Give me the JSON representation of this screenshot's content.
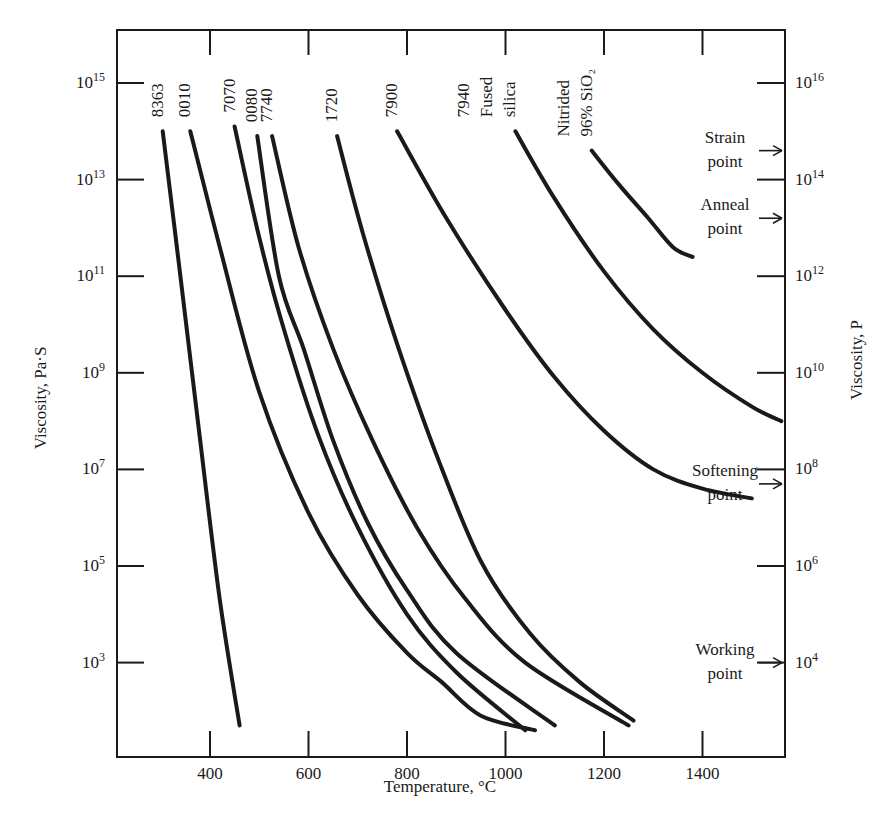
{
  "chart_data": {
    "type": "line",
    "title": "",
    "xlabel": "Temperature, °C",
    "ylabel": "Viscosity, Pa·S",
    "ylabel_right": "Viscosity, P",
    "x_scale": "linear",
    "y_scale": "log",
    "xlim": [
      215,
      1550
    ],
    "ylim_log10_pa_s": [
      0.8,
      16.1
    ],
    "grid": false,
    "x_ticks": [
      {
        "value": 400,
        "label": "400"
      },
      {
        "value": 600,
        "label": "600"
      },
      {
        "value": 800,
        "label": "800"
      },
      {
        "value": 1000,
        "label": "1000"
      },
      {
        "value": 1200,
        "label": "1200"
      },
      {
        "value": 1400,
        "label": "1400"
      }
    ],
    "y_ticks_left": [
      {
        "exp": 15,
        "base": "10",
        "sup": "15"
      },
      {
        "exp": 13,
        "base": "10",
        "sup": "13"
      },
      {
        "exp": 11,
        "base": "10",
        "sup": "11"
      },
      {
        "exp": 9,
        "base": "10",
        "sup": "9"
      },
      {
        "exp": 7,
        "base": "10",
        "sup": "7"
      },
      {
        "exp": 5,
        "base": "10",
        "sup": "5"
      },
      {
        "exp": 3,
        "base": "10",
        "sup": "3"
      }
    ],
    "y_ticks_right": [
      {
        "exp_pa_s": 15,
        "base": "10",
        "sup": "16"
      },
      {
        "exp_pa_s": 13,
        "base": "10",
        "sup": "14"
      },
      {
        "exp_pa_s": 11,
        "base": "10",
        "sup": "12"
      },
      {
        "exp_pa_s": 9,
        "base": "10",
        "sup": "10"
      },
      {
        "exp_pa_s": 7,
        "base": "10",
        "sup": "8"
      },
      {
        "exp_pa_s": 5,
        "base": "10",
        "sup": "6"
      },
      {
        "exp_pa_s": 3,
        "base": "10",
        "sup": "4"
      }
    ],
    "reference_points": [
      {
        "name": "Strain point",
        "lines": [
          "Strain",
          "point"
        ],
        "log10_pa_s": 13.6
      },
      {
        "name": "Anneal point",
        "lines": [
          "Anneal",
          "point"
        ],
        "log10_pa_s": 12.2
      },
      {
        "name": "Softening point",
        "lines": [
          "Softening",
          "point"
        ],
        "log10_pa_s": 6.7
      },
      {
        "name": "Working point",
        "lines": [
          "Working",
          "point"
        ],
        "log10_pa_s": 3.0
      }
    ],
    "series": [
      {
        "name": "8363",
        "label_lines": [
          "8363"
        ],
        "points": [
          [
            304,
            14.0
          ],
          [
            340,
            11.0
          ],
          [
            380,
            7.6
          ],
          [
            420,
            4.3
          ],
          [
            460,
            1.7
          ]
        ]
      },
      {
        "name": "0010",
        "label_lines": [
          "0010"
        ],
        "points": [
          [
            360,
            14.0
          ],
          [
            420,
            11.6
          ],
          [
            500,
            8.6
          ],
          [
            600,
            6.1
          ],
          [
            700,
            4.4
          ],
          [
            800,
            3.2
          ],
          [
            870,
            2.6
          ],
          [
            950,
            1.9
          ],
          [
            1060,
            1.6
          ]
        ]
      },
      {
        "name": "7070",
        "label_lines": [
          "7070"
        ],
        "points": [
          [
            450,
            14.1
          ],
          [
            500,
            11.8
          ],
          [
            550,
            9.9
          ],
          [
            620,
            7.7
          ],
          [
            700,
            5.8
          ],
          [
            800,
            4.0
          ],
          [
            900,
            2.8
          ],
          [
            1040,
            1.6
          ]
        ]
      },
      {
        "name": "0080",
        "label_lines": [
          "0080"
        ],
        "points": [
          [
            496,
            13.9
          ],
          [
            540,
            11.0
          ],
          [
            590,
            9.5
          ],
          [
            650,
            7.6
          ],
          [
            720,
            5.9
          ],
          [
            800,
            4.5
          ],
          [
            900,
            3.2
          ],
          [
            1100,
            1.7
          ]
        ]
      },
      {
        "name": "7740",
        "label_lines": [
          "7740"
        ],
        "points": [
          [
            526,
            13.9
          ],
          [
            580,
            11.6
          ],
          [
            650,
            9.5
          ],
          [
            730,
            7.6
          ],
          [
            820,
            5.8
          ],
          [
            920,
            4.3
          ],
          [
            1040,
            3.0
          ],
          [
            1250,
            1.7
          ]
        ]
      },
      {
        "name": "1720",
        "label_lines": [
          "1720"
        ],
        "points": [
          [
            658,
            13.9
          ],
          [
            710,
            11.9
          ],
          [
            780,
            9.6
          ],
          [
            860,
            7.3
          ],
          [
            950,
            5.1
          ],
          [
            1050,
            3.6
          ],
          [
            1150,
            2.6
          ],
          [
            1260,
            1.8
          ]
        ]
      },
      {
        "name": "7900",
        "label_lines": [
          "7900"
        ],
        "points": [
          [
            780,
            14.0
          ],
          [
            880,
            12.2
          ],
          [
            1000,
            10.3
          ],
          [
            1100,
            8.9
          ],
          [
            1200,
            7.8
          ],
          [
            1300,
            7.0
          ],
          [
            1400,
            6.6
          ],
          [
            1500,
            6.4
          ]
        ]
      },
      {
        "name": "7940 Fused silica",
        "label_lines": [
          "7940",
          "Fused",
          "silica"
        ],
        "points": [
          [
            1020,
            14.0
          ],
          [
            1100,
            12.6
          ],
          [
            1200,
            11.1
          ],
          [
            1300,
            9.9
          ],
          [
            1400,
            9.0
          ],
          [
            1500,
            8.3
          ],
          [
            1560,
            8.0
          ]
        ]
      },
      {
        "name": "Nitrided 96% SiO2",
        "label_lines": [
          "Nitrided",
          "96% SiO₂"
        ],
        "points": [
          [
            1175,
            13.6
          ],
          [
            1230,
            12.9
          ],
          [
            1290,
            12.2
          ],
          [
            1340,
            11.6
          ],
          [
            1380,
            11.4
          ]
        ]
      }
    ]
  }
}
